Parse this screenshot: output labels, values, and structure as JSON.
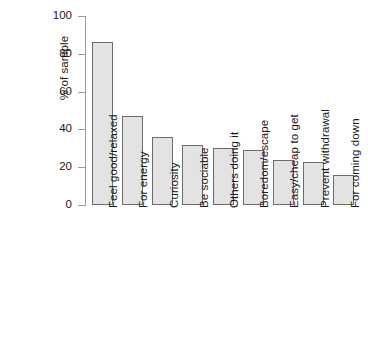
{
  "chart_data": {
    "type": "bar",
    "title": "",
    "subtitle": "",
    "xlabel": "",
    "ylabel": "% of sample",
    "ylim": [
      0,
      100
    ],
    "ytick_labels": [
      "0",
      "20",
      "40",
      "60",
      "80",
      "100"
    ],
    "yticks": [
      0,
      20,
      40,
      60,
      80,
      100
    ],
    "grid": false,
    "legend": null,
    "legend_position": "none",
    "bar_fill_color": "#e3e3e3",
    "bar_border_color": "#6b6b6b",
    "axis_color": "#9a9a9a",
    "text_color": "#1a1a1a",
    "categories": [
      "Feel good/relaxed",
      "For energy",
      "Curiosity",
      "Be sociable",
      "Others doing it",
      "Boredom/escape",
      "Easy/cheap to get",
      "Prevent withdrawal",
      "For coming down"
    ],
    "values": [
      86,
      47,
      36,
      32,
      30,
      29,
      24,
      22.5,
      16
    ],
    "annotations": []
  }
}
